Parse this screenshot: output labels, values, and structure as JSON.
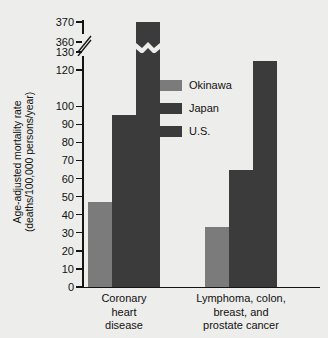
{
  "chart_data": {
    "type": "bar",
    "title": "",
    "subtitle": "",
    "xlabel": "",
    "ylabel_line1": "Age-adjusted mortality rate",
    "ylabel_line2": "(deaths/100,000 persons/year)",
    "categories": [
      "Coronary\nheart\ndisease",
      "Lymphoma, colon,\nbreast, and\nprostate cancer"
    ],
    "category_lines": [
      [
        "Coronary",
        "heart",
        "disease"
      ],
      [
        "Lymphoma, colon,",
        "breast, and",
        "prostate cancer"
      ]
    ],
    "series": [
      {
        "name": "Okinawa",
        "color": "#7b7b7b",
        "values": [
          47,
          33
        ]
      },
      {
        "name": "Japan",
        "color": "#3b3b3b",
        "values": [
          95,
          65
        ]
      },
      {
        "name": "U.S.",
        "color": "#3b3b3b",
        "values": [
          370,
          125
        ]
      }
    ],
    "legend_position": "inside-center",
    "grid": false,
    "axis_break": {
      "present": true,
      "below": 130,
      "above": 360,
      "note": "y-axis is broken between 130 and 360"
    },
    "bar_break_marks": [
      {
        "series": "U.S.",
        "category": "Coronary heart disease",
        "at_value": 358
      }
    ],
    "ylim_lower_segment": [
      0,
      130
    ],
    "ylim_upper_segment": [
      360,
      370
    ],
    "yticks": [
      0,
      10,
      20,
      30,
      40,
      50,
      60,
      70,
      80,
      90,
      100,
      120,
      130,
      360,
      370
    ],
    "ytick_labels": [
      "0",
      "10",
      "20",
      "30",
      "40",
      "50",
      "60",
      "70",
      "80",
      "90",
      "100",
      "120",
      "130",
      "360",
      "370"
    ]
  },
  "colors": {
    "background": "#ededeb",
    "axis": "#141414",
    "okinawa": "#7b7b7b",
    "japan": "#3b3b3b",
    "us": "#3b3b3b"
  }
}
